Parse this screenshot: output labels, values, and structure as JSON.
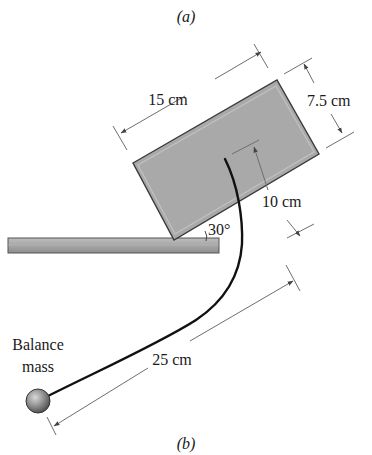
{
  "figure": {
    "caption_top": "(a)",
    "caption_bottom": "(b)"
  },
  "labels": {
    "length": "15 cm",
    "width": "7.5 cm",
    "height_offset": "10 cm",
    "angle": "30°",
    "arm_length": "25 cm",
    "mass_line1": "Balance",
    "mass_line2": "mass"
  },
  "colors": {
    "block_fill": "#a9a9a9",
    "block_edge": "#3a3a3a",
    "bar_fill": "#a3a3a3",
    "mass_fill": "#8a8a8a",
    "rod": "#111111",
    "dimension": "#6e6e6e"
  }
}
